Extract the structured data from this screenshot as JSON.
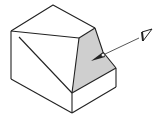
{
  "diagram": {
    "kind": "isometric-solid-with-view-direction",
    "colors": {
      "background": "#ffffff",
      "edge": "#222222",
      "shaded_face": "#cfcfcf",
      "arrow": "#333333"
    },
    "vertices": {
      "top": [
        53,
        5
      ],
      "left": [
        11,
        31
      ],
      "top_right": [
        95,
        28
      ],
      "inner": [
        79,
        38
      ],
      "right_mid": [
        116,
        68
      ],
      "right_bottom": [
        116,
        87
      ],
      "shade_bottom": [
        72,
        93
      ],
      "bottom": [
        72,
        113
      ],
      "left_bottom": [
        11,
        79
      ]
    },
    "shaded_face": "inclined-face",
    "view_arrow": {
      "from": [
        140,
        38
      ],
      "to": [
        92,
        60
      ],
      "symbol": "eye-icon"
    }
  }
}
